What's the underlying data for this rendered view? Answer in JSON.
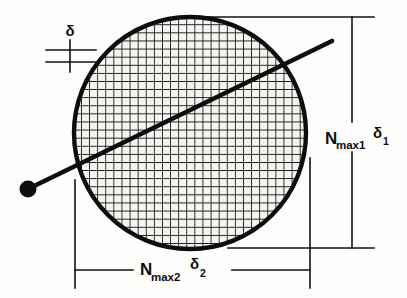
{
  "figure": {
    "kind": "technical-diagram",
    "background_color": "#fdfdfb",
    "ink_color": "#0d0d0d"
  },
  "labels": {
    "spacing": {
      "symbol": "δ",
      "name": "delta-spacing-label"
    },
    "vertical_dimension": {
      "base": "N",
      "base_subscript": "max1",
      "symbol": "δ",
      "symbol_subscript": "1",
      "full_text": "N max1 δ 1"
    },
    "horizontal_dimension": {
      "base": "N",
      "base_subscript": "max2",
      "symbol": "δ",
      "symbol_subscript": "2",
      "full_text": "N max2 δ 2"
    }
  },
  "geometry": {
    "circle": {
      "center_x": 190,
      "center_y": 133,
      "radius": 117,
      "stroke_width": 4,
      "fill": "#f2f2ee"
    },
    "grid": {
      "spacing": 8.1,
      "stroke_width": 1.7,
      "orientation": "orthogonal cross-hatch"
    },
    "ray": {
      "x1": 30,
      "y1": 188,
      "x2": 332,
      "y2": 41,
      "stroke_width": 4.5
    },
    "dot": {
      "cx": 28,
      "cy": 189,
      "r": 8.5,
      "fill": "#0d0d0d"
    }
  },
  "dimension_lines": {
    "vertical_right": {
      "x": 352,
      "y_top": 17,
      "y_bottom": 248
    },
    "horizontal_bottom": {
      "y": 270,
      "x_left": 75,
      "x_right": 310
    },
    "extension_top": {
      "y": 17,
      "x_left": 196,
      "x_right": 374
    },
    "extension_bottom": {
      "y": 248,
      "x_left": 228,
      "x_right": 374
    },
    "extension_left": {
      "x": 75,
      "y_top": 180,
      "y_bottom": 288
    },
    "extension_right": {
      "x": 310,
      "y_top": 158,
      "y_bottom": 288
    },
    "spacing_upper": {
      "y": 50,
      "x_left": 46,
      "x_right": 96
    },
    "spacing_lower": {
      "y": 62,
      "x_left": 46,
      "x_right": 96
    },
    "spacing_tick": {
      "x": 70,
      "y_top": 40,
      "y_bottom": 72
    }
  }
}
